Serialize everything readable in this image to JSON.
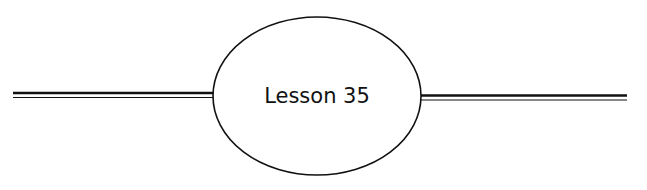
{
  "heading": {
    "label": "Lesson 35",
    "colors": {
      "ink": "#111111",
      "background": "#ffffff"
    }
  }
}
